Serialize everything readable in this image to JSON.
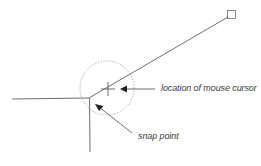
{
  "diagram": {
    "labels": {
      "cursor": "location of mouse cursor",
      "snap": "snap point"
    },
    "colors": {
      "line": "#4a4a4a",
      "circle": "#8a8a8a",
      "text": "#3a3a3a"
    }
  }
}
